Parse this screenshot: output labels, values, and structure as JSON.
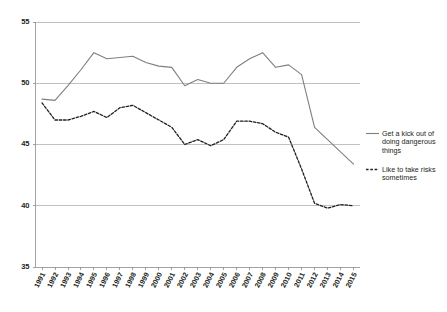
{
  "chart_data": {
    "type": "line",
    "title": "",
    "subtitle": "",
    "xlabel": "",
    "ylabel": "",
    "ylim": [
      35,
      55
    ],
    "yticks": [
      35,
      40,
      45,
      50,
      55
    ],
    "grid": true,
    "legend_position": "right",
    "categories": [
      "1991",
      "1992",
      "1993",
      "1994",
      "1995",
      "1996",
      "1997",
      "1998",
      "1999",
      "2000",
      "2001",
      "2002",
      "2003",
      "2004",
      "2005",
      "2006",
      "2007",
      "2008",
      "2009",
      "2010",
      "2011",
      "2012",
      "2013",
      "2014",
      "2015"
    ],
    "series": [
      {
        "name": "Get a kick out of doing dangerous things",
        "style": "solid",
        "color": "#7f7f7f",
        "values": [
          48.7,
          48.6,
          49.8,
          51.1,
          52.5,
          52.0,
          52.1,
          52.2,
          51.7,
          51.4,
          51.3,
          49.8,
          50.3,
          50.0,
          50.0,
          51.3,
          52.0,
          52.5,
          51.3,
          51.5,
          50.7,
          46.4,
          45.4,
          44.4,
          43.4
        ]
      },
      {
        "name": "Like to take risks sometimes",
        "style": "dashed",
        "color": "#231f20",
        "values": [
          48.4,
          47.0,
          47.0,
          47.3,
          47.7,
          47.2,
          48.0,
          48.2,
          47.6,
          47.0,
          46.4,
          45.0,
          45.4,
          44.9,
          45.4,
          46.9,
          46.9,
          46.7,
          46.0,
          45.6,
          43.0,
          40.2,
          39.8,
          40.1,
          40.0
        ]
      }
    ]
  },
  "legend": {
    "items": [
      {
        "label_line1": "Get a kick out of",
        "label_line2": "doing dangerous",
        "label_line3": "things",
        "style": "solid"
      },
      {
        "label_line1": "Like to take risks",
        "label_line2": "sometimes",
        "label_line3": "",
        "style": "dashed"
      }
    ]
  },
  "axis": {
    "y_labels": [
      "55",
      "50",
      "45",
      "40",
      "35"
    ],
    "x_labels": [
      "1991",
      "1992",
      "1993",
      "1994",
      "1995",
      "1996",
      "1997",
      "1998",
      "1999",
      "2000",
      "2001",
      "2002",
      "2003",
      "2004",
      "2005",
      "2006",
      "2007",
      "2008",
      "2009",
      "2010",
      "2011",
      "2012",
      "2013",
      "2014",
      "2015"
    ]
  },
  "colors": {
    "solid_series": "#7f7f7f",
    "dashed_series": "#231f20",
    "gridline": "#a6a6a6",
    "axis": "#8c8c8c",
    "background": "#ffffff"
  }
}
